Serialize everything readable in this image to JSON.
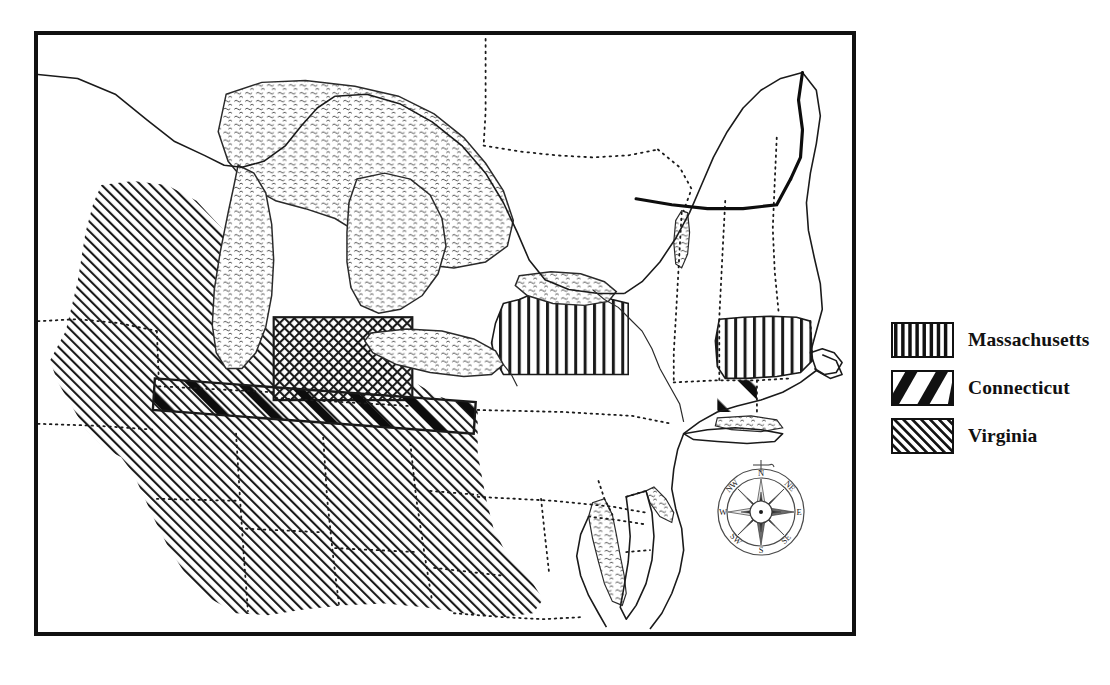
{
  "figure": {
    "kind": "historical-map",
    "background_color": "#ffffff",
    "ink_color": "#111111"
  },
  "map": {
    "frame": {
      "border_color": "#111111",
      "border_width_px": 4,
      "fill_color": "#ffffff"
    },
    "features": {
      "lakes": [
        "Lake Superior",
        "Lake Michigan",
        "Lake Huron",
        "Lake Erie",
        "Lake Ontario",
        "Lake Champlain"
      ],
      "water_fill_style": "stipple-wave",
      "state_boundary_style": "dotted",
      "coastline_style": "solid-thin",
      "unshaded_region_note": "Pennsylvania left blank"
    },
    "claim_regions": [
      {
        "name": "Massachusetts",
        "pattern": "vertical-bars",
        "areas": [
          "western New York strip",
          "Massachusetts proper",
          "western reserve strip"
        ]
      },
      {
        "name": "Connecticut",
        "pattern": "thick-diagonal-bars",
        "areas": [
          "Connecticut proper",
          "western Connecticut strip across the Ohio country"
        ]
      },
      {
        "name": "Virginia",
        "pattern": "fine-diagonal-hatch",
        "areas": [
          "Northwest Territory",
          "Virginia and the trans-Appalachian west"
        ]
      }
    ]
  },
  "legend": {
    "items": [
      {
        "label": "Massachusetts",
        "pattern": "vertical-bars"
      },
      {
        "label": "Connecticut",
        "pattern": "thick-diagonal-bars"
      },
      {
        "label": "Virginia",
        "pattern": "fine-diagonal-hatch"
      }
    ]
  },
  "compass": {
    "directions": {
      "n": "N",
      "ne": "NE",
      "e": "E",
      "se": "SE",
      "s": "S",
      "sw": "SW",
      "w": "W",
      "nw": "NW"
    }
  }
}
